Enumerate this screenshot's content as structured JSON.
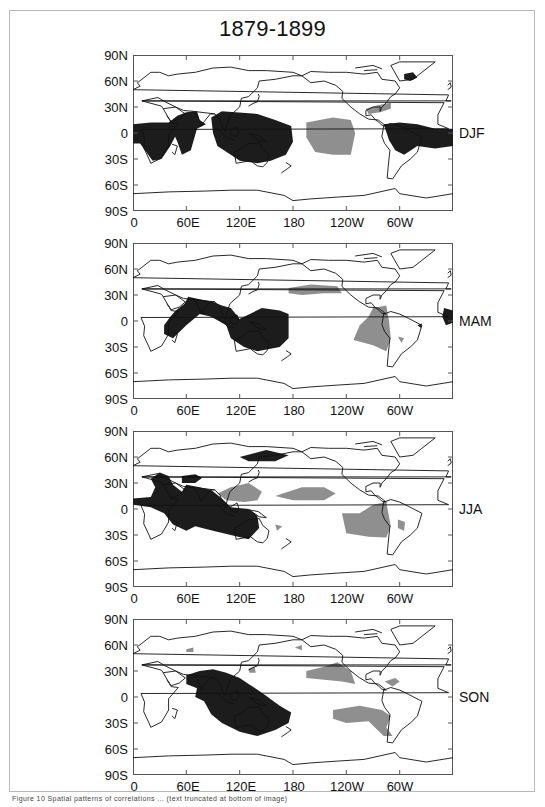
{
  "figure": {
    "title": "1879-1899",
    "caption": "Figure 10   Spatial patterns of correlations ... (text truncated at bottom of image)"
  },
  "axes": {
    "y_ticks": [
      "90N",
      "60N",
      "30N",
      "0",
      "30S",
      "60S",
      "90S"
    ],
    "x_ticks": [
      "0",
      "60E",
      "120E",
      "180",
      "120W",
      "60W"
    ]
  },
  "panels": [
    {
      "season": "DJF"
    },
    {
      "season": "MAM"
    },
    {
      "season": "JJA"
    },
    {
      "season": "SON"
    }
  ],
  "colors": {
    "positive_shade": "#1c1c1c",
    "negative_shade": "#8f8f8f",
    "coastline": "#111111",
    "frame": "#555555"
  },
  "chart_data": {
    "type": "heatmap",
    "title": "1879-1899",
    "projection": "equirectangular, longitude 0 to 360 (0 to 60W), latitude 90S to 90N",
    "xlabel": "Longitude",
    "ylabel": "Latitude",
    "x_tick_labels": [
      "0",
      "60E",
      "120E",
      "180",
      "120W",
      "60W"
    ],
    "y_tick_labels": [
      "90N",
      "60N",
      "30N",
      "0",
      "30S",
      "60S",
      "90S"
    ],
    "xlim": [
      0,
      360
    ],
    "ylim": [
      -90,
      90
    ],
    "legend": "none (dark shading = one sign, gray shading = opposite sign)",
    "panels": [
      {
        "season": "DJF",
        "dark_regions": [
          "tropical Africa & Indian Ocean 10N-30S, 0-50E",
          "Arabian Sea / India 25N-15S, 45-80E",
          "Maritime Continent / Australia / W Pacific 25N-35S, 90-180",
          "Northern S. America & tropical Atlantic 15N-20S, 280-360",
          "Greenland area 65-80N, 300-320"
        ],
        "gray_regions": [
          "Central/East tropical Pacific 15N-25S, 195-250",
          "Gulf of Mexico / Florida 20-35N, 260-290"
        ]
      },
      {
        "season": "MAM",
        "dark_regions": [
          "East Africa / Arabian Sea / India 25N-15S, 35-100E",
          "Maritime Continent / Australia / W Pacific 15N-35S, 95-175",
          "West Africa coast ~0-10N, 350-360",
          "NE Brazil ~5S, 322"
        ],
        "gray_regions": [
          "North Pacific 30-40N, 175-235",
          "Eastern tropical Pacific / W South America 10N-30S, 245-290",
          "S. Brazil ~20S, 300"
        ]
      },
      {
        "season": "JJA",
        "dark_regions": [
          "Africa / Indian Ocean / India 40N-30S, 0-130E",
          "Central Asia 30-38N, 55-75E",
          "NE Asia / Okhotsk 55-70N, 120-175",
          "Indonesia / N Australia 0-30S, 90-140"
        ],
        "gray_regions": [
          "SE Asia / W Pacific 10-30N, 90-145",
          "Central N. Pacific 10-25N, 160-225",
          "E Pacific / W South America 5N-30S, 235-290",
          "E Brazil 15-25S, 300-310"
        ]
      },
      {
        "season": "SON",
        "dark_regions": [
          "Indian Ocean / Maritime Continent / Australia / SW Pacific 25N-45S, 55-175"
        ],
        "gray_regions": [
          "NE Pacific 15-40N, 195-250",
          "Caribbean 15-20N, 285-300",
          "SE Pacific / S America 15-45S, 220-295",
          "Japan area 30-35N, 130-140",
          "Caspian area ~55N, 65E"
        ]
      }
    ]
  }
}
